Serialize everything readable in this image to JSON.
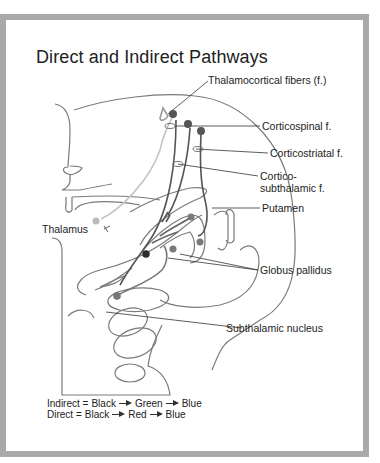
{
  "title": "Direct and Indirect Pathways",
  "labels": {
    "thalamocortical": "Thalamocortical fibers (f.)",
    "corticospinal": "Corticospinal f.",
    "corticostriatal": "Corticostriatal f.",
    "corticosubthalamic_1": "Cortico-",
    "corticosubthalamic_2": "subthalamic f.",
    "putamen": "Putamen",
    "thalamus": "Thalamus",
    "globus_pallidus": "Globus pallidus",
    "subthalamic_nucleus": "Subthalamic nucleus"
  },
  "legend": {
    "indirect": {
      "name": "Indirect =",
      "steps": [
        "Black",
        "Green",
        "Blue"
      ]
    },
    "direct": {
      "name": "Direct =",
      "steps": [
        "Black",
        "Red",
        "Blue"
      ]
    }
  },
  "colors": {
    "frame": "#a9a9a9",
    "outline": "#6f6f6f",
    "neuron_dark": "#555555",
    "neuron_mid": "#7a7a7a",
    "neuron_light": "#b5b5b5",
    "neuron_black": "#2e2e2e"
  }
}
